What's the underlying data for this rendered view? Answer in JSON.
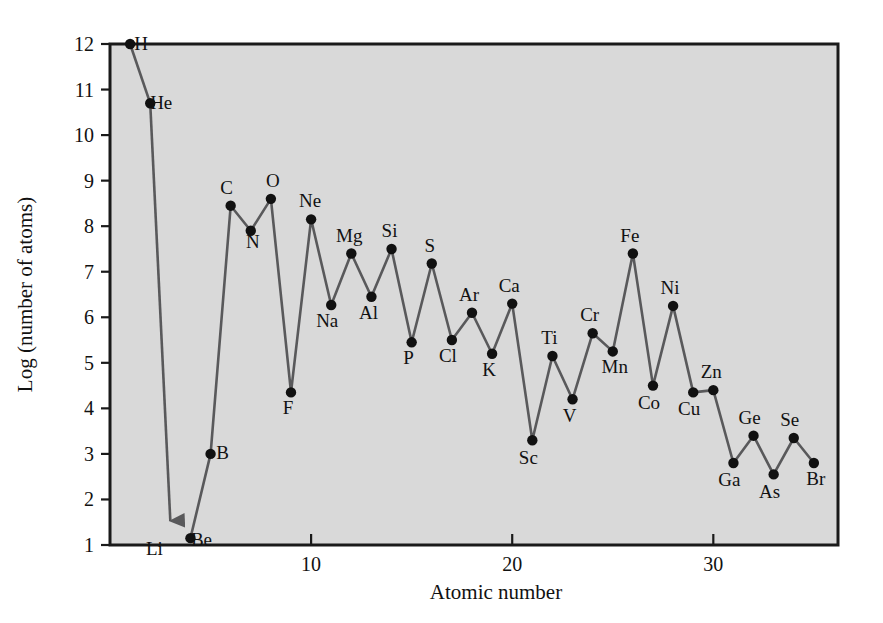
{
  "figure": {
    "background": "#ffffff",
    "plot_background": "#d9d9d9",
    "frame_color": "#1a1a1a",
    "line_color": "#59595b",
    "marker_color": "#111111"
  },
  "chart_data": {
    "type": "line",
    "title": "",
    "subtitle": "",
    "xlabel": "Atomic number",
    "ylabel": "Log (number of atoms)",
    "xlim": [
      0,
      36.2
    ],
    "ylim": [
      1,
      12
    ],
    "xticks": [
      10,
      20,
      30
    ],
    "xtick_labels": [
      "10",
      "20",
      "30"
    ],
    "yticks": [
      1,
      2,
      3,
      4,
      5,
      6,
      7,
      8,
      9,
      10,
      11,
      12
    ],
    "ytick_labels": [
      "1",
      "2",
      "3",
      "4",
      "5",
      "6",
      "7",
      "8",
      "9",
      "10",
      "11",
      "12"
    ],
    "grid": false,
    "legend": "none",
    "markers": "filled-circle",
    "x": [
      1,
      2,
      3,
      4,
      5,
      6,
      7,
      8,
      9,
      10,
      11,
      12,
      13,
      14,
      15,
      16,
      17,
      18,
      19,
      20,
      21,
      22,
      23,
      24,
      25,
      26,
      27,
      28,
      29,
      30,
      31,
      32,
      33,
      34,
      35
    ],
    "values": [
      12.0,
      10.7,
      0.5,
      1.15,
      3.0,
      8.45,
      7.9,
      8.6,
      4.35,
      8.15,
      6.27,
      7.4,
      6.45,
      7.5,
      5.45,
      7.18,
      5.5,
      6.1,
      5.2,
      6.3,
      3.3,
      5.15,
      4.2,
      5.65,
      5.25,
      7.4,
      4.5,
      6.25,
      4.35,
      4.4,
      2.8,
      3.4,
      2.55,
      3.35,
      2.8
    ],
    "point_labels": [
      "H",
      "He",
      "Li",
      "Be",
      "B",
      "C",
      "N",
      "O",
      "F",
      "Ne",
      "Na",
      "Mg",
      "Al",
      "Si",
      "P",
      "S",
      "Cl",
      "Ar",
      "K",
      "Ca",
      "Sc",
      "Ti",
      "V",
      "Cr",
      "Mn",
      "Fe",
      "Co",
      "Ni",
      "Cu",
      "Zn",
      "Ga",
      "Ge",
      "As",
      "Se",
      "Br"
    ],
    "label_offsets": [
      [
        11,
        6
      ],
      [
        11,
        6
      ],
      [
        -16,
        34
      ],
      [
        11,
        8
      ],
      [
        12,
        5
      ],
      [
        -4,
        -12
      ],
      [
        2,
        17
      ],
      [
        2,
        -12
      ],
      [
        -3,
        22
      ],
      [
        -1,
        -12
      ],
      [
        -4,
        22
      ],
      [
        -2,
        -12
      ],
      [
        -3,
        22
      ],
      [
        -2,
        -12
      ],
      [
        -3,
        22
      ],
      [
        -2,
        -12
      ],
      [
        -4,
        22
      ],
      [
        -3,
        -12
      ],
      [
        -3,
        22
      ],
      [
        -3,
        -12
      ],
      [
        -4,
        24
      ],
      [
        -3,
        -12
      ],
      [
        -3,
        23
      ],
      [
        -3,
        -12
      ],
      [
        2,
        22
      ],
      [
        -3,
        -12
      ],
      [
        -4,
        23
      ],
      [
        -3,
        -12
      ],
      [
        -4,
        23
      ],
      [
        -2,
        -12
      ],
      [
        -4,
        23
      ],
      [
        -4,
        -12
      ],
      [
        -4,
        24
      ],
      [
        -4,
        -12
      ],
      [
        2,
        22
      ]
    ],
    "below_scale_element": "Li"
  }
}
